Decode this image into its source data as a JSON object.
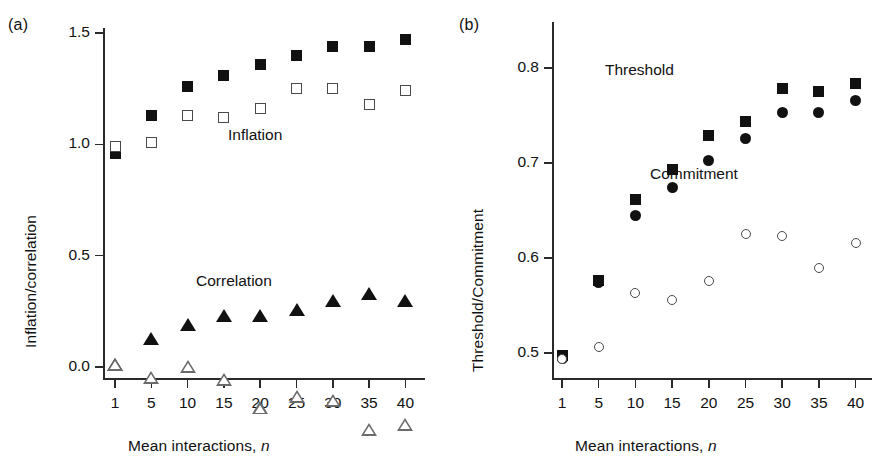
{
  "figure": {
    "panels": [
      {
        "tag": "(a)",
        "ylabel": "Inflation/correlation",
        "xlabel_main": "Mean interactions,",
        "xlabel_italic": "n",
        "annotations": [
          {
            "text": "Inflation",
            "x": 228,
            "y": 126
          },
          {
            "text": "Correlation",
            "x": 196,
            "y": 272
          }
        ]
      },
      {
        "tag": "(b)",
        "ylabel": "Threshold/Commitment",
        "xlabel_main": "Mean interactions,",
        "xlabel_italic": "n",
        "annotations": [
          {
            "text": "Threshold",
            "x": 158,
            "y": 61
          },
          {
            "text": "Commitment",
            "x": 203,
            "y": 165
          }
        ]
      }
    ]
  },
  "chart_data": [
    {
      "panel": "(a)",
      "type": "scatter",
      "title": "",
      "xlabel": "Mean interactions, n",
      "ylabel": "Inflation/correlation",
      "categories": [
        "1",
        "5",
        "10",
        "15",
        "20",
        "25",
        "30",
        "35",
        "40"
      ],
      "x": [
        1,
        5,
        10,
        15,
        20,
        25,
        30,
        35,
        40
      ],
      "ylim": [
        0.0,
        1.5
      ],
      "yticks": [
        "0.0",
        "0.5",
        "1.0",
        "1.5"
      ],
      "ytick_values": [
        0.0,
        0.5,
        1.0,
        1.5
      ],
      "grid": false,
      "legend": "inline-annotations",
      "series": [
        {
          "name": "Inflation (filled square)",
          "marker": "filled-square",
          "values": [
            0.96,
            1.13,
            1.26,
            1.31,
            1.36,
            1.4,
            1.44,
            1.44,
            1.47
          ]
        },
        {
          "name": "Inflation (open square)",
          "marker": "open-square",
          "values": [
            0.99,
            1.01,
            1.13,
            1.12,
            1.16,
            1.25,
            1.25,
            1.18,
            1.24
          ]
        },
        {
          "name": "Correlation (filled triangle)",
          "marker": "filled-triangle",
          "values": [
            0.01,
            0.13,
            0.19,
            0.23,
            0.23,
            0.26,
            0.3,
            0.33,
            0.3
          ]
        },
        {
          "name": "Correlation (open triangle)",
          "marker": "open-triangle",
          "values": [
            0.01,
            0.01,
            0.12,
            0.12,
            0.05,
            0.16,
            0.2,
            0.13,
            0.21
          ]
        }
      ]
    },
    {
      "panel": "(b)",
      "type": "scatter",
      "title": "",
      "xlabel": "Mean interactions, n",
      "ylabel": "Threshold/Commitment",
      "categories": [
        "1",
        "5",
        "10",
        "15",
        "20",
        "25",
        "30",
        "35",
        "40"
      ],
      "x": [
        1,
        5,
        10,
        15,
        20,
        25,
        30,
        35,
        40
      ],
      "ylim": [
        0.49,
        0.8
      ],
      "yticks": [
        "0.5",
        "0.6",
        "0.7",
        "0.8"
      ],
      "ytick_values": [
        0.5,
        0.6,
        0.7,
        0.8
      ],
      "grid": false,
      "legend": "inline-annotations",
      "series": [
        {
          "name": "Threshold (filled square)",
          "marker": "filled-square",
          "values": [
            0.497,
            0.576,
            0.662,
            0.693,
            0.729,
            0.744,
            0.778,
            0.775,
            0.784
          ]
        },
        {
          "name": "Threshold (filled circle)",
          "marker": "filled-circle",
          "values": [
            0.494,
            0.574,
            0.645,
            0.674,
            0.703,
            0.726,
            0.753,
            0.753,
            0.766
          ]
        },
        {
          "name": "Commitment (open circle)",
          "marker": "open-circle",
          "values": [
            0.494,
            0.506,
            0.563,
            0.556,
            0.576,
            0.625,
            0.623,
            0.589,
            0.616
          ]
        }
      ]
    }
  ]
}
